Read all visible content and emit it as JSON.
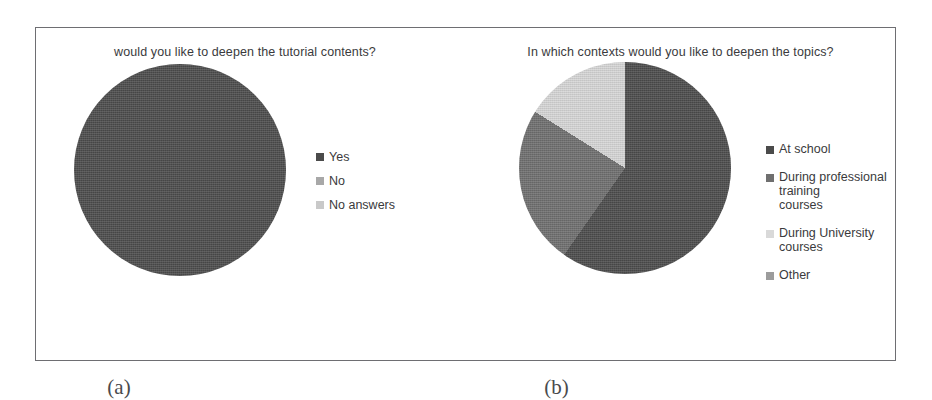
{
  "figure": {
    "caption_a": "(a)",
    "caption_b": "(b)"
  },
  "chart_data": [
    {
      "type": "pie",
      "panel": "a",
      "title": "would you like to deepen the tutorial contents?",
      "categories": [
        "Yes",
        "No",
        "No answers"
      ],
      "values": [
        75,
        25,
        0
      ],
      "unit": "percent",
      "colors": [
        "#4b4b4b",
        "#a8a8a8",
        "#d2d2d2"
      ],
      "legend_position": "right",
      "start_angle_deg": 0,
      "direction": "clockwise",
      "slices": [
        {
          "label": "Yes",
          "value": 75,
          "color": "#4b4b4b",
          "start_deg": 90,
          "end_deg": 360
        },
        {
          "label": "No",
          "value": 25,
          "color": "#a8a8a8",
          "start_deg": 0,
          "end_deg": 90
        },
        {
          "label": "No answers",
          "value": 0,
          "color": "#d2d2d2",
          "start_deg": 0,
          "end_deg": 0
        }
      ]
    },
    {
      "type": "pie",
      "panel": "b",
      "title": "In which contexts would you like to deepen the topics?",
      "categories": [
        "At school",
        "During professional training courses",
        "During University courses",
        "Other"
      ],
      "values": [
        33,
        24,
        32,
        11
      ],
      "unit": "percent",
      "colors": [
        "#4b4b4b",
        "#6f6f6f",
        "#d9d9d9",
        "#9c9c9c"
      ],
      "legend_position": "right",
      "start_angle_deg": 0,
      "direction": "clockwise",
      "slices": [
        {
          "label": "At school",
          "value": 33,
          "color": "#4b4b4b",
          "start_deg": 95,
          "end_deg": 215
        },
        {
          "label": "During professional training courses",
          "value": 24,
          "color": "#6f6f6f",
          "start_deg": 215,
          "end_deg": 302
        },
        {
          "label": "During University courses",
          "value": 32,
          "color": "#d9d9d9",
          "start_deg": 302,
          "end_deg": 55
        },
        {
          "label": "Other",
          "value": 11,
          "color": "#9c9c9c",
          "start_deg": 55,
          "end_deg": 95
        }
      ]
    }
  ],
  "panel_a": {
    "title": "would you like to deepen the tutorial contents?",
    "legend": [
      {
        "label": "Yes",
        "color": "#4b4b4b"
      },
      {
        "label": "No",
        "color": "#a8a8a8"
      },
      {
        "label": "No answers",
        "color": "#c9c9c9"
      }
    ]
  },
  "panel_b": {
    "title": "In which contexts would you like to deepen the topics?",
    "legend": [
      {
        "label": "At school",
        "color": "#4b4b4b"
      },
      {
        "label": "During professional training\ncourses",
        "color": "#6f6f6f"
      },
      {
        "label": "During University courses",
        "color": "#d9d9d9"
      },
      {
        "label": "Other",
        "color": "#9c9c9c"
      }
    ]
  }
}
